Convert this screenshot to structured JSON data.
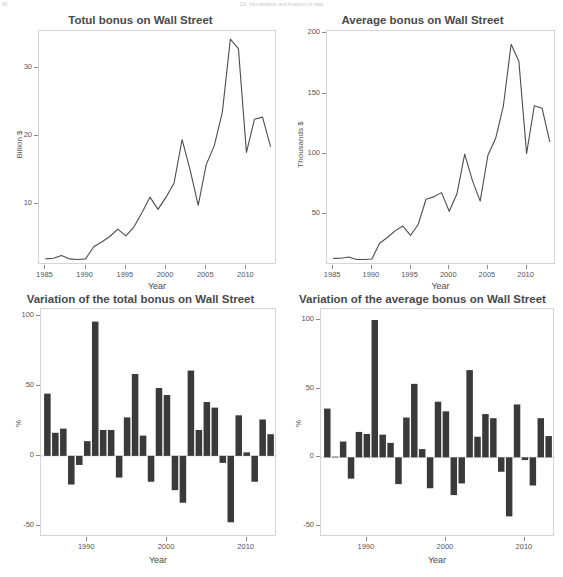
{
  "header": {
    "left": "96",
    "center": "Ch. Visualization and Analysis of data"
  },
  "axis_labels": {
    "year": "Year",
    "billion": "Billion $",
    "thousands": "Thousands $",
    "percent": "%"
  },
  "chart_data": [
    {
      "id": "total-bonus",
      "type": "line",
      "title": "Totul bonus on Wall Street",
      "xlabel": "Year",
      "ylabel": "Billion $",
      "xlim": [
        1984.2,
        2013.8
      ],
      "ylim": [
        1.0,
        35.5
      ],
      "xticks": [
        1985,
        1990,
        1995,
        2000,
        2005,
        2010
      ],
      "yticks": [
        10,
        20,
        30
      ],
      "grid": false,
      "x": [
        1985,
        1986,
        1987,
        1988,
        1989,
        1990,
        1991,
        1992,
        1993,
        1994,
        1995,
        1996,
        1997,
        1998,
        1999,
        2000,
        2001,
        2002,
        2003,
        2004,
        2005,
        2006,
        2007,
        2008,
        2009,
        2010,
        2011,
        2012,
        2013
      ],
      "values": [
        1.9,
        2.0,
        2.4,
        1.9,
        1.8,
        1.9,
        3.7,
        4.4,
        5.2,
        6.3,
        5.3,
        6.6,
        8.7,
        11.0,
        9.2,
        11.0,
        13.1,
        19.5,
        15.0,
        9.8,
        15.8,
        18.6,
        23.5,
        34.3,
        32.9,
        17.6,
        22.5,
        22.8,
        18.4,
        20.4,
        26.7
      ],
      "series_note": "one value per year 1985-2013"
    },
    {
      "id": "average-bonus",
      "type": "line",
      "title": "Average bonus on Wall Street",
      "xlabel": "Year",
      "ylabel": "Thousands $",
      "xlim": [
        1984.2,
        2013.8
      ],
      "ylim": [
        8,
        202
      ],
      "xticks": [
        1985,
        1990,
        1995,
        2000,
        2005,
        2010
      ],
      "yticks": [
        50,
        100,
        150,
        200
      ],
      "grid": false,
      "x": [
        1985,
        1986,
        1987,
        1988,
        1989,
        1990,
        1991,
        1992,
        1993,
        1994,
        1995,
        1996,
        1997,
        1998,
        1999,
        2000,
        2001,
        2002,
        2003,
        2004,
        2005,
        2006,
        2007,
        2008,
        2009,
        2010,
        2011,
        2012,
        2013
      ],
      "values": [
        13.5,
        13.6,
        14.6,
        12.5,
        12.6,
        13.0,
        26.0,
        30.8,
        36.3,
        40.3,
        32.5,
        41.8,
        62.5,
        64.5,
        68.0,
        52.5,
        67.0,
        100.0,
        78.0,
        61.0,
        99.0,
        113.0,
        140.0,
        191.0,
        177.0,
        100.5,
        140.0,
        138.0,
        110.0,
        128.0,
        163.5
      ],
      "series_note": "one value per year 1985-2013"
    },
    {
      "id": "variation-total-bonus",
      "type": "bar",
      "title": "Variation of the total bonus on Wall Street",
      "xlabel": "Year",
      "ylabel": "%",
      "xlim": [
        1984.2,
        2013.8
      ],
      "ylim": [
        -58,
        105
      ],
      "xticks": [
        1990,
        2000,
        2010
      ],
      "yticks": [
        -50,
        0,
        50,
        100
      ],
      "grid": false,
      "categories": [
        1985,
        1986,
        1987,
        1988,
        1989,
        1990,
        1991,
        1992,
        1993,
        1994,
        1995,
        1996,
        1997,
        1998,
        1999,
        2000,
        2001,
        2002,
        2003,
        2004,
        2005,
        2006,
        2007,
        2008,
        2009,
        2010,
        2011,
        2012,
        2013
      ],
      "values": [
        44.5,
        16.5,
        19.5,
        -20.5,
        -6.5,
        10.5,
        96.0,
        18.5,
        18.5,
        -15.5,
        27.5,
        58.5,
        14.5,
        -18.5,
        48.5,
        43.5,
        -24.5,
        -33.5,
        61.0,
        18.5,
        38.5,
        34.5,
        -5.0,
        -47.5,
        29.0,
        2.5,
        -18.5,
        26.0,
        15.5
      ]
    },
    {
      "id": "variation-average-bonus",
      "type": "bar",
      "title": "Variation of the average bonus on Wall Street",
      "xlabel": "Year",
      "ylabel": "%",
      "xlim": [
        1984.2,
        2013.8
      ],
      "ylim": [
        -58,
        108
      ],
      "xticks": [
        1990,
        2000,
        2010
      ],
      "yticks": [
        -50,
        0,
        50,
        100
      ],
      "grid": false,
      "categories": [
        1985,
        1986,
        1987,
        1988,
        1989,
        1990,
        1991,
        1992,
        1993,
        1994,
        1995,
        1996,
        1997,
        1998,
        1999,
        2000,
        2001,
        2002,
        2003,
        2004,
        2005,
        2006,
        2007,
        2008,
        2009,
        2010,
        2011,
        2012,
        2013
      ],
      "values": [
        35.5,
        0.5,
        11.5,
        -15.5,
        18.5,
        17.0,
        100.0,
        16.5,
        10.5,
        -19.5,
        29.0,
        53.5,
        6.0,
        -22.5,
        40.5,
        33.5,
        -27.5,
        -19.0,
        63.5,
        15.0,
        31.5,
        28.5,
        -10.5,
        -43.0,
        38.5,
        -2.0,
        -20.5,
        28.5,
        15.5
      ]
    }
  ],
  "colors": {
    "line": "#4d4d4d",
    "bar": "#3a3a3a",
    "frame": "#d4d4d4",
    "text": "#4a4a4a",
    "tick": "#8a8a8a"
  }
}
